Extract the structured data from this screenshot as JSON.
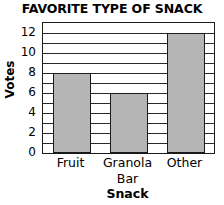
{
  "chart_data": {
    "type": "bar",
    "title": "FAVORITE TYPE OF SNACK",
    "xlabel": "Snack",
    "ylabel": "Votes",
    "categories": [
      "Fruit",
      "Granola\nBar",
      "Other"
    ],
    "values": [
      8,
      6,
      12
    ],
    "ylim": [
      0,
      13
    ],
    "yticks": [
      0,
      2,
      4,
      6,
      8,
      10,
      12
    ],
    "ytick_labels": [
      "0",
      "2",
      "4",
      "6",
      "8",
      "10",
      "12"
    ],
    "grid": "horizontal gridlines every 1 unit",
    "legend": "none",
    "bar_color": "#b5b5b5",
    "bar_edge_color": "#1a1a1a",
    "axis_color": "#1a1a1a",
    "background": "#ffffff"
  }
}
